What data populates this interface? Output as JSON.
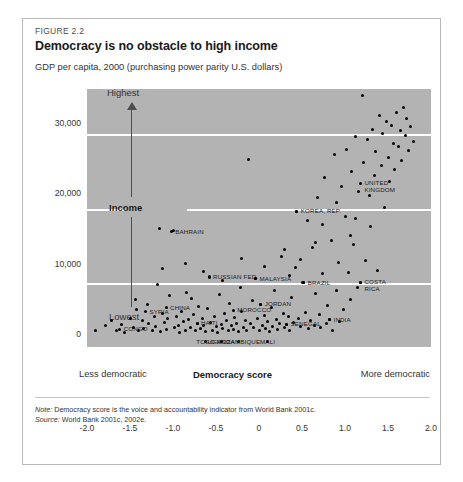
{
  "figure": {
    "number": "FIGURE 2.2",
    "title": "Democracy is no obstacle to high income",
    "subtitle": "GDP per capita, 2000 (purchasing power parity U.S. dollars)",
    "note_label": "Note:",
    "note_text": " Democracy score is the voice and accountability indicator from World Bank 2001c.",
    "source_label": "Source:",
    "source_text": " World Bank 2001c, 2002e."
  },
  "axis": {
    "y_ticks": [
      "30,000",
      "20,000",
      "10,000",
      "0"
    ],
    "x_ticks": [
      "-2.0",
      "-1.5",
      "-1.0",
      "-0.5",
      "0",
      "0.5",
      "1.0",
      "1.5",
      "2.0"
    ],
    "x_title": "Democracy score",
    "x_left_label": "Less democratic",
    "x_right_label": "More democratic",
    "y_highest": "Highest",
    "y_income": "Income",
    "y_lowest": "Lowest"
  },
  "colors": {
    "plot_background": "#b3b3b3",
    "gridline": "#ffffff",
    "dot": "#000000",
    "border": "#b8b8b8",
    "arrow": "#4d4d4d"
  },
  "chart_data": {
    "type": "scatter",
    "title": "Democracy is no obstacle to high income",
    "subtitle": "GDP per capita, 2000 (purchasing power parity U.S. dollars)",
    "xlabel": "Democracy score",
    "ylabel": "GDP per capita, 2000 (PPP U.S. dollars)",
    "xlim": [
      -2.0,
      2.0
    ],
    "ylim": [
      0,
      35000
    ],
    "xticks": [
      -2.0,
      -1.5,
      -1.0,
      -0.5,
      0,
      0.5,
      1.0,
      1.5,
      2.0
    ],
    "yticks": [
      0,
      10000,
      20000,
      30000
    ],
    "grid": "horizontal",
    "legend": "none",
    "annotations": [
      {
        "label": "CONGO",
        "x": -1.62,
        "y": 800,
        "anchor": "left"
      },
      {
        "label": "SYRIA",
        "x": -1.32,
        "y": 3300,
        "anchor": "left"
      },
      {
        "label": "CHINA",
        "x": -1.08,
        "y": 3900,
        "anchor": "left"
      },
      {
        "label": "HAITI",
        "x": -0.72,
        "y": 1700,
        "anchor": "left"
      },
      {
        "label": "TOGO",
        "x": -0.62,
        "y": -900,
        "anchor": "center"
      },
      {
        "label": "UGANDA",
        "x": -0.44,
        "y": -900,
        "anchor": "center"
      },
      {
        "label": "MOZAMBIQUE",
        "x": -0.24,
        "y": -900,
        "anchor": "center"
      },
      {
        "label": "MALI",
        "x": 0.1,
        "y": -900,
        "anchor": "center"
      },
      {
        "label": "MOROCCO",
        "x": -0.3,
        "y": 3500,
        "anchor": "left"
      },
      {
        "label": "JORDAN",
        "x": 0.02,
        "y": 4400,
        "anchor": "left"
      },
      {
        "label": "SENEGAL",
        "x": 0.32,
        "y": 1500,
        "anchor": "left"
      },
      {
        "label": "INDIA",
        "x": 0.82,
        "y": 2200,
        "anchor": "left"
      },
      {
        "label": "RUSSIAN FED.",
        "x": -0.58,
        "y": 8200,
        "anchor": "left"
      },
      {
        "label": "MALAYSIA",
        "x": -0.04,
        "y": 8000,
        "anchor": "left"
      },
      {
        "label": "BRAZIL",
        "x": 0.52,
        "y": 7400,
        "anchor": "left"
      },
      {
        "label": "COSTA RICA",
        "x": 1.18,
        "y": 7500,
        "anchor": "left"
      },
      {
        "label": "BAHRAIN",
        "x": -1.02,
        "y": 14700,
        "anchor": "left"
      },
      {
        "label": "KOREA, REP.",
        "x": 0.44,
        "y": 17600,
        "anchor": "left"
      },
      {
        "label": "UNITED KINGDOM",
        "x": 1.18,
        "y": 21600,
        "anchor": "left"
      }
    ],
    "points": [
      [
        -1.9,
        700
      ],
      [
        -1.78,
        1400
      ],
      [
        -1.72,
        2100
      ],
      [
        -1.66,
        600
      ],
      [
        -1.6,
        1500
      ],
      [
        -1.56,
        300
      ],
      [
        -1.5,
        2400
      ],
      [
        -1.46,
        1100
      ],
      [
        -1.42,
        3600
      ],
      [
        -1.4,
        700
      ],
      [
        -1.36,
        2000
      ],
      [
        -1.34,
        900
      ],
      [
        -1.3,
        4300
      ],
      [
        -1.28,
        1600
      ],
      [
        -1.24,
        600
      ],
      [
        -1.22,
        2700
      ],
      [
        -1.2,
        1200
      ],
      [
        -1.16,
        15200
      ],
      [
        -1.14,
        500
      ],
      [
        -1.12,
        3100
      ],
      [
        -1.1,
        1800
      ],
      [
        -1.08,
        800
      ],
      [
        -1.06,
        2300
      ],
      [
        -1.04,
        5600
      ],
      [
        -1.0,
        14800
      ],
      [
        -0.98,
        1000
      ],
      [
        -0.96,
        2600
      ],
      [
        -1.12,
        9500
      ],
      [
        -0.94,
        1400
      ],
      [
        -0.92,
        400
      ],
      [
        -0.9,
        3300
      ],
      [
        -0.88,
        1900
      ],
      [
        -0.86,
        700
      ],
      [
        -0.84,
        6100
      ],
      [
        -0.82,
        2200
      ],
      [
        -0.8,
        1100
      ],
      [
        -0.78,
        5200
      ],
      [
        -0.76,
        2900
      ],
      [
        -0.74,
        600
      ],
      [
        -0.72,
        1600
      ],
      [
        -0.7,
        4100
      ],
      [
        -0.68,
        900
      ],
      [
        -0.66,
        2400
      ],
      [
        -0.64,
        1300
      ],
      [
        -0.62,
        500
      ],
      [
        -0.6,
        3700
      ],
      [
        -0.58,
        8300
      ],
      [
        -0.56,
        1800
      ],
      [
        -0.54,
        700
      ],
      [
        -0.52,
        2700
      ],
      [
        -0.5,
        1200
      ],
      [
        -0.48,
        400
      ],
      [
        -0.46,
        5800
      ],
      [
        -0.44,
        1500
      ],
      [
        -0.42,
        900
      ],
      [
        -0.4,
        3000
      ],
      [
        -0.38,
        2000
      ],
      [
        -0.36,
        600
      ],
      [
        -0.34,
        4500
      ],
      [
        -0.32,
        1300
      ],
      [
        -0.3,
        800
      ],
      [
        -0.28,
        2500
      ],
      [
        -0.26,
        1700
      ],
      [
        -0.24,
        500
      ],
      [
        -0.22,
        6700
      ],
      [
        -0.2,
        3400
      ],
      [
        -0.18,
        1100
      ],
      [
        -0.16,
        2100
      ],
      [
        -0.14,
        700
      ],
      [
        -0.12,
        24900
      ],
      [
        -0.1,
        1600
      ],
      [
        -0.08,
        4900
      ],
      [
        -0.06,
        1000
      ],
      [
        -0.04,
        8100
      ],
      [
        -0.02,
        2300
      ],
      [
        0.0,
        600
      ],
      [
        0.02,
        4400
      ],
      [
        0.04,
        1400
      ],
      [
        0.06,
        2800
      ],
      [
        0.08,
        900
      ],
      [
        0.1,
        1900
      ],
      [
        0.12,
        500
      ],
      [
        0.14,
        3900
      ],
      [
        0.16,
        1200
      ],
      [
        0.18,
        6300
      ],
      [
        0.2,
        2200
      ],
      [
        0.22,
        800
      ],
      [
        0.24,
        1700
      ],
      [
        0.26,
        11200
      ],
      [
        0.28,
        3100
      ],
      [
        0.3,
        1000
      ],
      [
        0.32,
        1500
      ],
      [
        0.34,
        2600
      ],
      [
        0.36,
        700
      ],
      [
        0.38,
        5400
      ],
      [
        0.4,
        1800
      ],
      [
        0.42,
        9600
      ],
      [
        0.44,
        17600
      ],
      [
        0.46,
        2400
      ],
      [
        0.48,
        1200
      ],
      [
        0.5,
        7500
      ],
      [
        0.52,
        7400
      ],
      [
        0.54,
        3200
      ],
      [
        0.56,
        16300
      ],
      [
        0.58,
        900
      ],
      [
        0.6,
        2000
      ],
      [
        0.62,
        12400
      ],
      [
        0.64,
        1400
      ],
      [
        0.66,
        5900
      ],
      [
        0.68,
        19600
      ],
      [
        0.7,
        2900
      ],
      [
        0.72,
        1100
      ],
      [
        0.74,
        8700
      ],
      [
        0.76,
        22400
      ],
      [
        0.78,
        1700
      ],
      [
        0.8,
        4200
      ],
      [
        0.82,
        2200
      ],
      [
        0.84,
        13500
      ],
      [
        0.86,
        700
      ],
      [
        0.88,
        25700
      ],
      [
        0.9,
        6400
      ],
      [
        0.92,
        10300
      ],
      [
        0.94,
        1900
      ],
      [
        0.96,
        21100
      ],
      [
        0.98,
        3600
      ],
      [
        1.0,
        16800
      ],
      [
        1.02,
        26400
      ],
      [
        1.04,
        8900
      ],
      [
        1.06,
        5100
      ],
      [
        1.08,
        23300
      ],
      [
        1.1,
        12900
      ],
      [
        1.12,
        28200
      ],
      [
        1.14,
        6800
      ],
      [
        1.16,
        20400
      ],
      [
        1.18,
        7500
      ],
      [
        1.2,
        34100
      ],
      [
        1.22,
        24600
      ],
      [
        1.24,
        10600
      ],
      [
        1.26,
        27800
      ],
      [
        1.28,
        19800
      ],
      [
        1.3,
        15400
      ],
      [
        1.32,
        29300
      ],
      [
        1.34,
        22700
      ],
      [
        1.36,
        26100
      ],
      [
        1.38,
        9200
      ],
      [
        1.4,
        31200
      ],
      [
        1.42,
        24100
      ],
      [
        1.44,
        28700
      ],
      [
        1.46,
        18200
      ],
      [
        1.48,
        30400
      ],
      [
        1.5,
        25300
      ],
      [
        1.52,
        21800
      ],
      [
        1.54,
        29800
      ],
      [
        1.56,
        27200
      ],
      [
        1.58,
        23600
      ],
      [
        1.6,
        31600
      ],
      [
        1.62,
        26800
      ],
      [
        1.64,
        29100
      ],
      [
        1.66,
        24800
      ],
      [
        1.68,
        32400
      ],
      [
        1.7,
        28400
      ],
      [
        1.72,
        30800
      ],
      [
        1.74,
        26200
      ],
      [
        1.76,
        29600
      ],
      [
        1.8,
        27600
      ],
      [
        1.12,
        16600
      ],
      [
        1.06,
        14200
      ],
      [
        0.9,
        18900
      ],
      [
        0.74,
        15700
      ],
      [
        0.66,
        13100
      ],
      [
        -1.44,
        5100
      ],
      [
        -1.18,
        7200
      ],
      [
        -0.86,
        10200
      ],
      [
        -0.64,
        9100
      ],
      [
        -0.42,
        7800
      ],
      [
        -0.2,
        10900
      ],
      [
        0.06,
        9800
      ],
      [
        0.3,
        12100
      ],
      [
        0.48,
        10800
      ],
      [
        0.36,
        8400
      ]
    ]
  }
}
